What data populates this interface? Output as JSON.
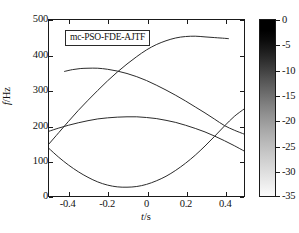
{
  "chart_data": {
    "type": "line",
    "title": "",
    "xlabel": "t/s",
    "ylabel": "f/Hz",
    "xlim": [
      -0.5,
      0.5
    ],
    "ylim": [
      0,
      500
    ],
    "xticks": [
      "-0.4",
      "-0.2",
      "0",
      "0.2",
      "0.4"
    ],
    "xtick_values": [
      -0.4,
      -0.2,
      0,
      0.2,
      0.4
    ],
    "yticks": [
      "0",
      "100",
      "200",
      "300",
      "400",
      "500"
    ],
    "ytick_values": [
      0,
      100,
      200,
      300,
      400,
      500
    ],
    "grid": false,
    "legend": "mc-PSO-FDE-AJTF",
    "legend_position": "upper-left-inside",
    "line_color": "#2b2b2b",
    "series": [
      {
        "name": "rising-curve",
        "x": [
          -0.5,
          -0.45,
          -0.4,
          -0.35,
          -0.3,
          -0.25,
          -0.2,
          -0.15,
          -0.1,
          -0.05,
          0.0,
          0.05,
          0.1,
          0.15,
          0.2,
          0.25,
          0.3,
          0.35,
          0.4,
          0.42
        ],
        "values": [
          148,
          180,
          212,
          243,
          272,
          300,
          327,
          352,
          375,
          396,
          415,
          430,
          441,
          449,
          453,
          454,
          452,
          450,
          448,
          447
        ]
      },
      {
        "name": "descending-curve",
        "x": [
          -0.42,
          -0.38,
          -0.34,
          -0.3,
          -0.25,
          -0.2,
          -0.15,
          -0.1,
          -0.05,
          0.0,
          0.05,
          0.1,
          0.15,
          0.2,
          0.25,
          0.3,
          0.35,
          0.4,
          0.45,
          0.5
        ],
        "values": [
          354,
          359,
          362,
          363,
          363,
          360,
          355,
          348,
          339,
          328,
          315,
          301,
          286,
          270,
          253,
          236,
          218,
          200,
          187,
          176
        ]
      },
      {
        "name": "hump-curve",
        "x": [
          -0.5,
          -0.45,
          -0.4,
          -0.35,
          -0.3,
          -0.25,
          -0.2,
          -0.15,
          -0.1,
          -0.05,
          0.0,
          0.05,
          0.1,
          0.15,
          0.2,
          0.25,
          0.3,
          0.35,
          0.4,
          0.45,
          0.5
        ],
        "values": [
          184,
          193,
          201,
          208,
          214,
          219,
          222,
          224,
          225,
          225,
          223,
          220,
          215,
          209,
          201,
          192,
          182,
          170,
          157,
          143,
          128
        ]
      },
      {
        "name": "valley-curve",
        "x": [
          -0.5,
          -0.45,
          -0.4,
          -0.35,
          -0.3,
          -0.25,
          -0.2,
          -0.15,
          -0.1,
          -0.05,
          0.0,
          0.05,
          0.1,
          0.15,
          0.2,
          0.25,
          0.3,
          0.35,
          0.4,
          0.45,
          0.5
        ],
        "values": [
          135,
          110,
          88,
          69,
          53,
          40,
          31,
          26,
          25,
          27,
          33,
          43,
          56,
          73,
          93,
          116,
          142,
          170,
          199,
          226,
          247
        ]
      }
    ]
  },
  "colorbar": {
    "ticks": [
      "0",
      "-5",
      "-10",
      "-15",
      "-20",
      "-25",
      "-30",
      "-35"
    ],
    "tick_values": [
      0,
      -5,
      -10,
      -15,
      -20,
      -25,
      -30,
      -35
    ],
    "min": -35,
    "max": 0,
    "top_color": "#000000",
    "bottom_color": "#ffffff"
  }
}
